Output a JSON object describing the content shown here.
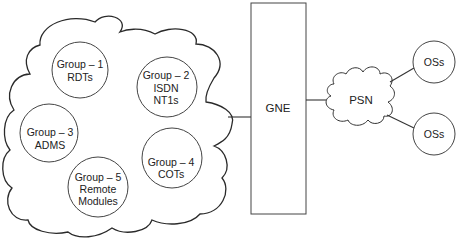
{
  "diagram": {
    "type": "network-topology",
    "access_network": {
      "shape": "cloud",
      "groups": [
        {
          "id": "group-1",
          "lines": [
            "Group – 1",
            "RDTs"
          ]
        },
        {
          "id": "group-2",
          "lines": [
            "Group – 2",
            "ISDN",
            "NT1s"
          ]
        },
        {
          "id": "group-3",
          "lines": [
            "Group – 3",
            "ADMS"
          ]
        },
        {
          "id": "group-4",
          "lines": [
            "Group – 4",
            "COTs"
          ]
        },
        {
          "id": "group-5",
          "lines": [
            "Group – 5",
            "Remote",
            "Modules"
          ]
        }
      ]
    },
    "gne": {
      "label": "GNE"
    },
    "psn": {
      "label": "PSN"
    },
    "operations_systems": [
      {
        "label": "OSs"
      },
      {
        "label": "OSs"
      }
    ],
    "connections": [
      {
        "from": "access_network",
        "to": "gne"
      },
      {
        "from": "gne",
        "to": "psn"
      },
      {
        "from": "psn",
        "to": "operations_systems.0"
      },
      {
        "from": "psn",
        "to": "operations_systems.1"
      }
    ]
  },
  "colors": {
    "stroke": "#333333",
    "text": "#222222",
    "background": "#ffffff"
  }
}
